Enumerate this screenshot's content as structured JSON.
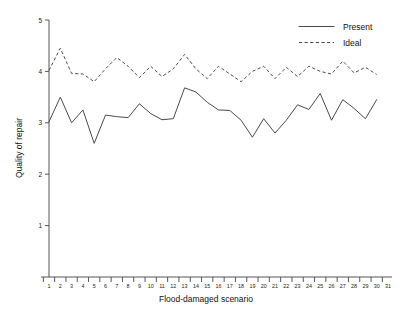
{
  "chart_data": {
    "type": "line",
    "title": "",
    "xlabel": "Flood-damaged scenario",
    "ylabel": "Quality of repair",
    "xlim": [
      1,
      31
    ],
    "ylim": [
      0,
      5
    ],
    "yticks": [
      1,
      2,
      3,
      4,
      5
    ],
    "ytick_labels": [
      "1",
      "2",
      "3",
      "4",
      "5"
    ],
    "grid": false,
    "legend_position": "top-right",
    "x": [
      1,
      2,
      3,
      4,
      5,
      6,
      7,
      8,
      9,
      10,
      11,
      12,
      13,
      14,
      15,
      16,
      17,
      18,
      19,
      20,
      21,
      22,
      23,
      24,
      25,
      26,
      27,
      28,
      29,
      30
    ],
    "xtick_labels": [
      "1",
      "2",
      "3",
      "4",
      "5",
      "6",
      "7",
      "8",
      "9",
      "10",
      "11",
      "12",
      "13",
      "14",
      "15",
      "16",
      "17",
      "18",
      "19",
      "20",
      "21",
      "22",
      "23",
      "24",
      "25",
      "26",
      "27",
      "28",
      "29",
      "30",
      "31"
    ],
    "series": [
      {
        "name": "Present",
        "style": "solid",
        "color": "#4a4a4a",
        "values": [
          3.02,
          3.5,
          3.0,
          3.25,
          2.6,
          3.15,
          3.12,
          3.1,
          3.37,
          3.18,
          3.06,
          3.08,
          3.68,
          3.6,
          3.4,
          3.25,
          3.24,
          3.05,
          2.72,
          3.08,
          2.8,
          3.05,
          3.35,
          3.26,
          3.57,
          3.05,
          3.45,
          3.28,
          3.08,
          3.45
        ]
      },
      {
        "name": "Ideal",
        "style": "dashed",
        "color": "#4a4a4a",
        "values": [
          4.02,
          4.45,
          3.96,
          3.95,
          3.8,
          4.05,
          4.27,
          4.1,
          3.88,
          4.1,
          3.9,
          4.05,
          4.33,
          4.05,
          3.86,
          4.1,
          3.95,
          3.8,
          4.0,
          4.1,
          3.86,
          4.08,
          3.9,
          4.1,
          4.0,
          3.95,
          4.2,
          3.97,
          4.08,
          3.94
        ]
      }
    ]
  },
  "legend": {
    "entries": [
      {
        "label": "Present"
      },
      {
        "label": "Ideal"
      }
    ]
  },
  "axes": {
    "y_title": "Quality of repair",
    "x_title": "Flood-damaged scenario"
  }
}
